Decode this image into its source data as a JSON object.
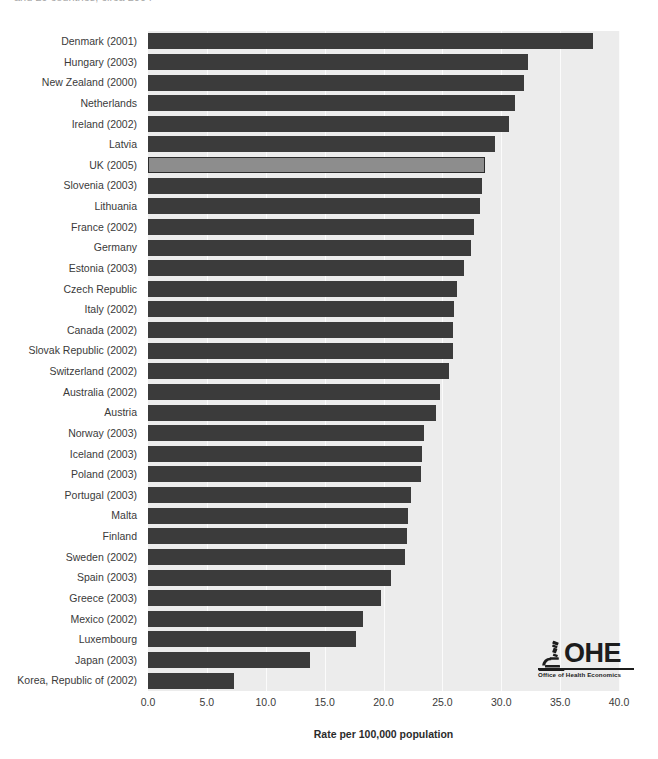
{
  "chart_title": "and 29 countries, circa 2004",
  "logo": {
    "wordmark": "OHE",
    "tagline": "Office of Health Economics",
    "microscope_icon": "microscope-icon"
  },
  "axis": {
    "xlabel": "Rate per 100,000 population",
    "xticks": [
      "0.0",
      "5.0",
      "10.0",
      "15.0",
      "20.0",
      "25.0",
      "30.0",
      "35.0",
      "40.0"
    ]
  },
  "colors": {
    "bar": "#3b3b3b",
    "highlight_bar": "#8d8d8d",
    "highlight_border": "#2b2b2b",
    "plot_background": "#ececec",
    "gridline": "#fbfbfb"
  },
  "chart_data": {
    "type": "bar",
    "orientation": "horizontal",
    "title": "and 29 countries, circa 2004",
    "xlabel": "Rate per 100,000 population",
    "ylabel": "",
    "xlim": [
      0.0,
      40.0
    ],
    "xticks": [
      0.0,
      5.0,
      10.0,
      15.0,
      20.0,
      25.0,
      30.0,
      35.0,
      40.0
    ],
    "grid": true,
    "legend": "none",
    "highlight_category": "UK (2005)",
    "categories": [
      "Denmark (2001)",
      "Hungary (2003)",
      "New Zealand (2000)",
      "Netherlands",
      "Ireland (2002)",
      "Latvia",
      "UK (2005)",
      "Slovenia (2003)",
      "Lithuania",
      "France (2002)",
      "Germany",
      "Estonia (2003)",
      "Czech Republic",
      "Italy (2002)",
      "Canada (2002)",
      "Slovak Republic (2002)",
      "Switzerland (2002)",
      "Australia (2002)",
      "Austria",
      "Norway (2003)",
      "Iceland (2003)",
      "Poland (2003)",
      "Portugal (2003)",
      "Malta",
      "Finland",
      "Sweden (2002)",
      "Spain (2003)",
      "Greece (2003)",
      "Mexico (2002)",
      "Luxembourg",
      "Japan (2003)",
      "Korea, Republic of (2002)"
    ],
    "values": [
      37.8,
      32.3,
      31.9,
      31.2,
      30.7,
      29.5,
      28.6,
      28.4,
      28.2,
      27.7,
      27.4,
      26.8,
      26.2,
      26.0,
      25.9,
      25.9,
      25.6,
      24.8,
      24.5,
      23.4,
      23.3,
      23.2,
      22.3,
      22.1,
      22.0,
      21.8,
      20.6,
      19.8,
      18.3,
      17.7,
      13.8,
      7.3
    ]
  }
}
